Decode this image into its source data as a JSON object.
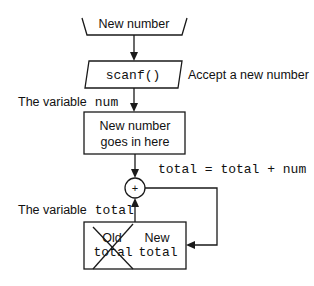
{
  "diagram": {
    "input_box": {
      "label": "New number"
    },
    "scanf_box": {
      "label": "scanf()",
      "annotation": "Accept a new number"
    },
    "num_variable": {
      "caption_prefix": "The variable",
      "caption_var": "num",
      "box_line1": "New number",
      "box_line2": "goes in here"
    },
    "adder": {
      "symbol": "+",
      "formula": "total = total + num"
    },
    "total_variable": {
      "caption_prefix": "The variable",
      "caption_var": "total",
      "old_line1": "Old",
      "old_line2": "total",
      "new_line1": "New",
      "new_line2": "total"
    }
  }
}
